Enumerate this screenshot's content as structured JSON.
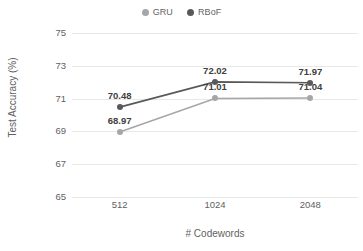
{
  "chart_data": {
    "type": "line",
    "title": "",
    "xlabel": "# Codewords",
    "ylabel": "Test Accuracy (%)",
    "categories": [
      "512",
      "1024",
      "2048"
    ],
    "ylim": [
      65,
      75
    ],
    "yticks": [
      "65",
      "67",
      "69",
      "71",
      "73",
      "75"
    ],
    "grid": true,
    "legend_position": "top-center",
    "series": [
      {
        "name": "GRU",
        "color": "#a6a6a6",
        "values": [
          68.97,
          71.01,
          71.04
        ],
        "labels": [
          "68.97",
          "71.01",
          "71.04"
        ]
      },
      {
        "name": "RBoF",
        "color": "#595959",
        "values": [
          70.48,
          72.02,
          71.97
        ],
        "labels": [
          "70.48",
          "72.02",
          "71.97"
        ]
      }
    ]
  },
  "legend": {
    "entries": [
      {
        "label": "GRU",
        "marker": "circle-marker-gru"
      },
      {
        "label": "RBoF",
        "marker": "circle-marker-rbof"
      }
    ]
  },
  "axes": {
    "y_title": "Test Accuracy (%)",
    "x_title": "# Codewords"
  }
}
